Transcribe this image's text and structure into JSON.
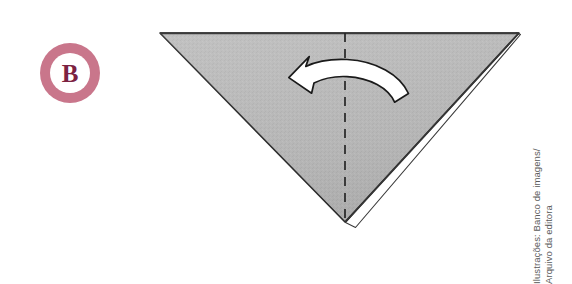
{
  "figure": {
    "background_color": "#ffffff"
  },
  "step_badge": {
    "label": "B",
    "ring_color": "#c9768b",
    "inner_color": "#ffffff",
    "letter_color": "#7c2242",
    "icon_name": "step-badge-b"
  },
  "illustration": {
    "name": "inverted-triangle-fold-diagram",
    "paper": {
      "name": "triangle-paper-front",
      "fill_color": "#b6b6b6",
      "stroke_color": "#2b2b2b",
      "vertices": [
        [
          160,
          33
        ],
        [
          519,
          33
        ],
        [
          345,
          222
        ]
      ]
    },
    "back_flap": {
      "name": "triangle-back-flap-sliver",
      "fill_color": "#ffffff",
      "stroke_color": "#3a3a3a"
    },
    "fold_line": {
      "name": "center-fold-dashed-line",
      "style": "dashed",
      "color": "#262626",
      "from": [
        345,
        33
      ],
      "to": [
        345,
        222
      ]
    },
    "arrow": {
      "name": "fold-direction-arrow",
      "direction": "right-to-left",
      "fill_color": "#ffffff",
      "stroke_color": "#1a1a1a"
    }
  },
  "credit": {
    "line1": "Ilustrações: Banco de imagens/",
    "line2": "Arquivo da editora",
    "color": "#5a5a5a"
  }
}
